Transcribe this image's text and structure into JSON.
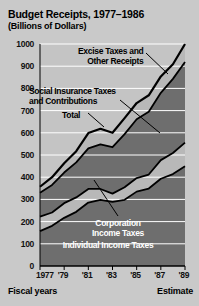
{
  "header": {
    "title": "Budget Receipts, 1977–1986",
    "subtitle": "(Billions of Dollars)"
  },
  "footer": {
    "fiscal_years_label": "Fiscal years",
    "estimate_label": "Estimate"
  },
  "annotations": {
    "excise_line1": "Excise Taxes and",
    "excise_line2": "Other Receipts",
    "social_line1": "Social Insurance Taxes",
    "social_line2": "and Contributions",
    "total": "Total",
    "corporation_line1": "Corporation",
    "corporation_line2": "Income Taxes",
    "individual": "Individual Income Taxes"
  },
  "colors": {
    "background": "#c9c9c9",
    "plot_background": "#c4c4c4",
    "band_individual": "#6e6e6e",
    "band_corporation": "#b8b8b8",
    "band_social": "#6e6e6e",
    "band_excise": "#b8b8b8",
    "outline": "#000000",
    "gridline": "#ffffff",
    "axis_text": "#111111"
  },
  "chart_data": {
    "type": "area",
    "stacked": true,
    "title": "Budget Receipts, 1977–1986",
    "subtitle": "(Billions of Dollars)",
    "xlabel": "Fiscal years",
    "ylabel": "Billions of Dollars",
    "ylim": [
      0,
      1000
    ],
    "ytick_values": [
      0,
      100,
      200,
      300,
      400,
      500,
      600,
      700,
      800,
      900,
      1000
    ],
    "ytick_labels": [
      "0",
      "100",
      "200",
      "300",
      "400",
      "500",
      "600",
      "700",
      "800",
      "900",
      "1000"
    ],
    "grid": true,
    "grid_axis": "y",
    "legend_position": "inline-annotations",
    "x": [
      1977,
      1978,
      1979,
      1980,
      1981,
      1982,
      1983,
      1984,
      1985,
      1986,
      1987,
      1988,
      1989
    ],
    "xtick_values": [
      1977,
      1979,
      1981,
      1983,
      1985,
      1987,
      1989
    ],
    "xtick_labels": [
      "1977",
      "'79",
      "'81",
      "'83",
      "'85",
      "'87",
      "'89"
    ],
    "estimate_note": "Estimate",
    "series": [
      {
        "name": "Individual Income Taxes",
        "values": [
          157,
          181,
          217,
          244,
          286,
          298,
          289,
          298,
          335,
          349,
          393,
          414,
          449
        ]
      },
      {
        "name": "Corporation Income Taxes",
        "values": [
          65,
          60,
          66,
          65,
          61,
          49,
          37,
          57,
          61,
          63,
          84,
          95,
          107
        ]
      },
      {
        "name": "Social Insurance Taxes and Contributions",
        "values": [
          108,
          124,
          138,
          158,
          183,
          201,
          209,
          239,
          265,
          283,
          303,
          334,
          363
        ]
      },
      {
        "name": "Excise Taxes and Other Receipts",
        "values": [
          27,
          35,
          42,
          50,
          69,
          70,
          65,
          72,
          73,
          74,
          74,
          66,
          81
        ]
      }
    ],
    "totals": [
      357,
      400,
      463,
      517,
      599,
      618,
      600,
      666,
      734,
      769,
      854,
      909,
      1000
    ]
  }
}
